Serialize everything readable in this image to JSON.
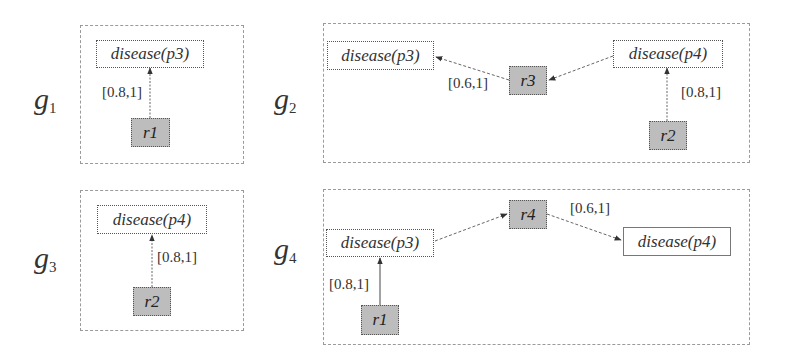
{
  "graphs": [
    {
      "id": "g1",
      "label_base": "g",
      "label_sub": "1",
      "nodes": {
        "atom1": "disease(p3)",
        "rule1": "r1"
      },
      "edges": [
        {
          "from": "r1",
          "to": "disease(p3)",
          "label": "[0.8,1]"
        }
      ]
    },
    {
      "id": "g2",
      "label_base": "g",
      "label_sub": "2",
      "nodes": {
        "atom1": "disease(p3)",
        "rule3": "r3",
        "atom2": "disease(p4)",
        "rule2": "r2"
      },
      "edges": [
        {
          "from": "r3",
          "to": "disease(p3)",
          "label": "[0.6,1]"
        },
        {
          "from": "disease(p4)",
          "to": "r3",
          "label": ""
        },
        {
          "from": "r2",
          "to": "disease(p4)",
          "label": "[0.8,1]"
        }
      ]
    },
    {
      "id": "g3",
      "label_base": "g",
      "label_sub": "3",
      "nodes": {
        "atom1": "disease(p4)",
        "rule2": "r2"
      },
      "edges": [
        {
          "from": "r2",
          "to": "disease(p4)",
          "label": "[0.8,1]"
        }
      ]
    },
    {
      "id": "g4",
      "label_base": "g",
      "label_sub": "4",
      "nodes": {
        "atom1": "disease(p3)",
        "rule4": "r4",
        "atom2": "disease(p4)",
        "rule1": "r1"
      },
      "edges": [
        {
          "from": "disease(p3)",
          "to": "r4",
          "label": ""
        },
        {
          "from": "r4",
          "to": "disease(p4)",
          "label": "[0.6,1]"
        },
        {
          "from": "r1",
          "to": "disease(p3)",
          "label": "[0.8,1]"
        }
      ]
    }
  ],
  "colors": {
    "rule_fill": "#bdbdbd",
    "frame": "#9a9a9a",
    "edge": "#555555",
    "text": "#333333"
  }
}
